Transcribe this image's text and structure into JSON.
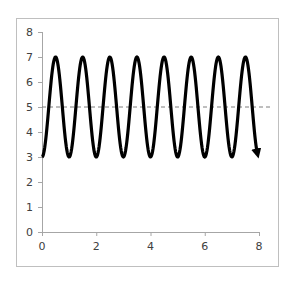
{
  "chart_data": {
    "type": "line",
    "title": "",
    "xlabel": "",
    "ylabel": "",
    "xlim": [
      0,
      8
    ],
    "ylim": [
      0,
      8
    ],
    "x_ticks": [
      0,
      2,
      4,
      6,
      8
    ],
    "y_ticks": [
      0,
      1,
      2,
      3,
      4,
      5,
      6,
      7,
      8
    ],
    "grid": false,
    "legend": null,
    "series": [
      {
        "name": "oscillation",
        "style": "thick black line with arrowhead at end",
        "function": "y = 5 - 2*cos(2*pi*x)",
        "x": [
          0,
          0.5,
          1,
          1.5,
          2,
          2.5,
          3,
          3.5,
          4,
          4.5,
          5,
          5.5,
          6,
          6.5,
          7,
          7.5,
          7.95
        ],
        "values": [
          3,
          7,
          3,
          7,
          3,
          7,
          3,
          7,
          3,
          7,
          3,
          7,
          3,
          7,
          3,
          7,
          3.2
        ],
        "color": "#000000"
      },
      {
        "name": "reference",
        "style": "dashed gray horizontal line",
        "x": [
          0,
          8.3
        ],
        "values": [
          5,
          5
        ],
        "color": "#808080"
      }
    ],
    "annotations": []
  },
  "colors": {
    "curve": "#000000",
    "dashed_line": "#7f7f7f",
    "axis": "#a6a6a6",
    "frame": "#bfbfbf",
    "tick_text": "#404040"
  }
}
